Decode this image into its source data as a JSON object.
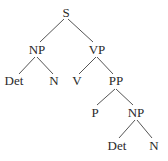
{
  "diagram": {
    "type": "syntax-tree",
    "nodes": [
      {
        "id": "s",
        "label": "S",
        "x": 66,
        "y": 14
      },
      {
        "id": "np1",
        "label": "NP",
        "x": 37,
        "y": 51
      },
      {
        "id": "vp",
        "label": "VP",
        "x": 97,
        "y": 51
      },
      {
        "id": "det1",
        "label": "Det",
        "x": 14,
        "y": 82
      },
      {
        "id": "n1",
        "label": "N",
        "x": 54,
        "y": 82
      },
      {
        "id": "v",
        "label": "V",
        "x": 77,
        "y": 82
      },
      {
        "id": "pp",
        "label": "PP",
        "x": 116,
        "y": 82
      },
      {
        "id": "p",
        "label": "P",
        "x": 95,
        "y": 114
      },
      {
        "id": "np2",
        "label": "NP",
        "x": 136,
        "y": 114
      },
      {
        "id": "det2",
        "label": "Det",
        "x": 117,
        "y": 147
      },
      {
        "id": "n2",
        "label": "N",
        "x": 154,
        "y": 147
      }
    ],
    "edges": [
      {
        "from": "s",
        "to": "np1",
        "x1": 64,
        "y1": 19,
        "x2": 40,
        "y2": 42
      },
      {
        "from": "s",
        "to": "vp",
        "x1": 68,
        "y1": 19,
        "x2": 93,
        "y2": 42
      },
      {
        "from": "np1",
        "to": "det1",
        "x1": 35,
        "y1": 57,
        "x2": 19,
        "y2": 74
      },
      {
        "from": "np1",
        "to": "n1",
        "x1": 37,
        "y1": 57,
        "x2": 53,
        "y2": 74
      },
      {
        "from": "vp",
        "to": "v",
        "x1": 96,
        "y1": 57,
        "x2": 79,
        "y2": 74
      },
      {
        "from": "vp",
        "to": "pp",
        "x1": 97,
        "y1": 57,
        "x2": 113,
        "y2": 74
      },
      {
        "from": "pp",
        "to": "p",
        "x1": 115,
        "y1": 89,
        "x2": 97,
        "y2": 105
      },
      {
        "from": "pp",
        "to": "np2",
        "x1": 116,
        "y1": 89,
        "x2": 133,
        "y2": 105
      },
      {
        "from": "np2",
        "to": "det2",
        "x1": 135,
        "y1": 120,
        "x2": 119,
        "y2": 138
      },
      {
        "from": "np2",
        "to": "n2",
        "x1": 137,
        "y1": 120,
        "x2": 152,
        "y2": 138
      }
    ]
  }
}
